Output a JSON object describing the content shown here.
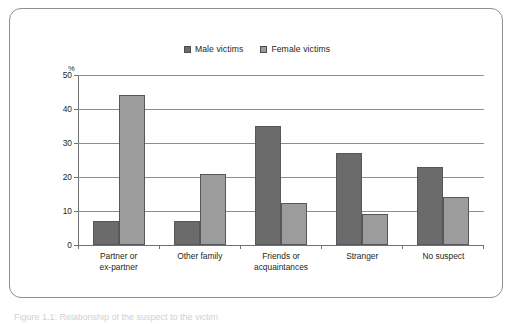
{
  "figure": {
    "caption_partial": "Figure 1.1: Relationship of the suspect to the victim",
    "panel_border_color": "#8d8f92"
  },
  "legend": {
    "position": "top-center",
    "entries": [
      {
        "label": "Male victims",
        "color": "#6b6b6b",
        "swatch": "legend-swatch-male"
      },
      {
        "label": "Female victims",
        "color": "#9c9c9c",
        "swatch": "legend-swatch-female"
      }
    ]
  },
  "axes": {
    "y_unit_label": "%",
    "y_ticks": [
      "0",
      "10",
      "20",
      "30",
      "40",
      "50"
    ],
    "x_labels": [
      [
        "Partner or",
        "ex-partner"
      ],
      [
        "Other family",
        ""
      ],
      [
        "Friends or",
        "acquaintances"
      ],
      [
        "Stranger",
        ""
      ],
      [
        "No suspect",
        ""
      ]
    ]
  },
  "x_label_lines": {
    "g0l1": "Partner or",
    "g0l2": "ex-partner",
    "g1l1": "Other family",
    "g1l2": "",
    "g2l1": "Friends or",
    "g2l2": "acquaintances",
    "g3l1": "Stranger",
    "g3l2": "",
    "g4l1": "No suspect",
    "g4l2": ""
  },
  "y_tick_labels": {
    "t0": "50",
    "t1": "40",
    "t2": "30",
    "t3": "20",
    "t4": "10",
    "t5": "0"
  },
  "chart_data": {
    "type": "bar",
    "title": "",
    "subtitle": "",
    "xlabel": "",
    "ylabel": "%",
    "ylim": [
      0,
      50
    ],
    "ytick_step": 10,
    "grid": true,
    "legend_position": "top-center",
    "categories": [
      "Partner or ex-partner",
      "Other family",
      "Friends or acquaintances",
      "Stranger",
      "No suspect"
    ],
    "series": [
      {
        "name": "Male victims",
        "color": "#6b6b6b",
        "values": [
          7,
          7,
          35,
          27,
          23
        ]
      },
      {
        "name": "Female victims",
        "color": "#9c9c9c",
        "values": [
          44,
          21,
          12.5,
          9,
          14
        ]
      }
    ]
  }
}
